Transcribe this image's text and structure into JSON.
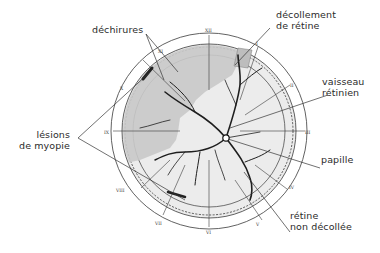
{
  "diagram": {
    "title": "",
    "labels": {
      "dechirures": "déchirures",
      "decollement_line1": "décollement",
      "decollement_line2": "de rétine",
      "vaisseau_line1": "vaisseau",
      "vaisseau_line2": "rétinien",
      "lesions_line1": "lésions",
      "lesions_line2": "de myopie",
      "papille": "papille",
      "retine_line1": "rétine",
      "retine_line2": "non décollée"
    },
    "clock_hours": [
      "XII",
      "I",
      "II",
      "III",
      "IV",
      "V",
      "VI",
      "VII",
      "VIII",
      "IX",
      "X",
      "XI"
    ],
    "colors": {
      "ink": "#2b2b2b",
      "detached_shade": "#c9c9c9",
      "attached_shade": "#ececec",
      "background": "#ffffff"
    }
  }
}
